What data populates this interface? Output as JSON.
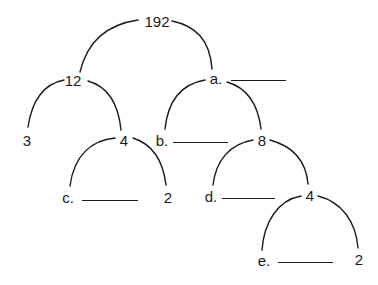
{
  "diagram": {
    "type": "factor-tree",
    "root": "192",
    "nodes": [
      {
        "id": "root",
        "label": "192"
      },
      {
        "id": "n12",
        "label": "12"
      },
      {
        "id": "a",
        "label": "a.",
        "blank": true
      },
      {
        "id": "n3",
        "label": "3"
      },
      {
        "id": "n4_left",
        "label": "4"
      },
      {
        "id": "b",
        "label": "b.",
        "blank": true
      },
      {
        "id": "n8",
        "label": "8"
      },
      {
        "id": "c",
        "label": "c.",
        "blank": true
      },
      {
        "id": "n2_left",
        "label": "2"
      },
      {
        "id": "d",
        "label": "d.",
        "blank": true
      },
      {
        "id": "n4_right",
        "label": "4"
      },
      {
        "id": "e",
        "label": "e.",
        "blank": true
      },
      {
        "id": "n2_right",
        "label": "2"
      }
    ],
    "edges": [
      [
        "root",
        "n12"
      ],
      [
        "root",
        "a"
      ],
      [
        "n12",
        "n3"
      ],
      [
        "n12",
        "n4_left"
      ],
      [
        "n4_left",
        "c"
      ],
      [
        "n4_left",
        "n2_left"
      ],
      [
        "a",
        "b"
      ],
      [
        "a",
        "n8"
      ],
      [
        "n8",
        "d"
      ],
      [
        "n8",
        "n4_right"
      ],
      [
        "n4_right",
        "e"
      ],
      [
        "n4_right",
        "n2_right"
      ]
    ]
  },
  "labels": {
    "root": "192",
    "n12": "12",
    "a": "a.",
    "n3": "3",
    "n4_left": "4",
    "b": "b.",
    "n8": "8",
    "c": "c.",
    "n2_left": "2",
    "d": "d.",
    "n4_right": "4",
    "e": "e.",
    "n2_right": "2"
  },
  "colors": {
    "ink": "#1a1a1a",
    "background": "#ffffff"
  }
}
